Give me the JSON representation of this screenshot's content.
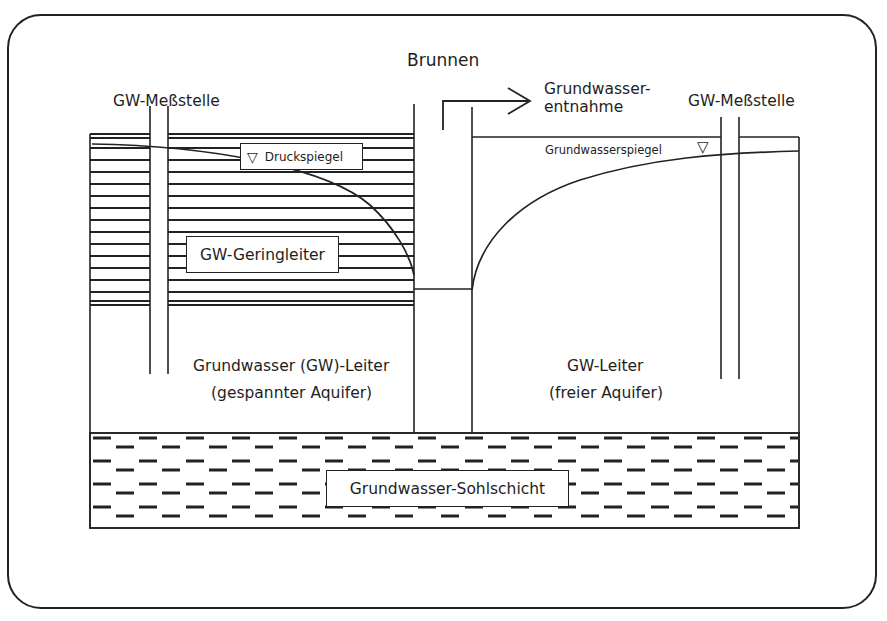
{
  "diagram": {
    "title": "Brunnen",
    "labels": {
      "left_well": "GW-Meßstelle",
      "right_well": "GW-Meßstelle",
      "extraction_line1": "Grundwasser-",
      "extraction_line2": "entnahme",
      "pressure_level": "Druckspiegel",
      "water_table": "Grundwasserspiegel",
      "aquitard": "GW-Geringleiter",
      "confined_line1": "Grundwasser (GW)-Leiter",
      "confined_line2": "(gespannter Aquifer)",
      "unconfined_line1": "GW-Leiter",
      "unconfined_line2": "(freier Aquifer)",
      "base_layer": "Grundwasser-Sohlschicht"
    },
    "symbols": {
      "level_marker": "▽"
    },
    "colors": {
      "line": "#222222",
      "background": "#ffffff"
    }
  }
}
